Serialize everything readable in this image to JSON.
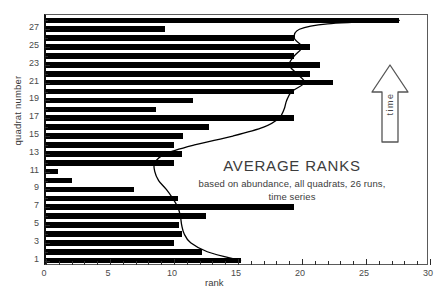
{
  "chart_data": {
    "type": "bar",
    "orientation": "horizontal",
    "title": "AVERAGE RANKS",
    "subtitle": "based on abundance, all quadrats, 26 runs,\ntime series",
    "subtitle_line1": "based on abundance, all quadrats, 26 runs,",
    "subtitle_line2": "time series",
    "xlabel": "rank",
    "ylabel": "quadrat number",
    "xlim": [
      0,
      30
    ],
    "ylim": [
      0.4,
      28.6
    ],
    "xticks": [
      0,
      5,
      10,
      15,
      20,
      25,
      30
    ],
    "xtick_labels": [
      "0",
      "5",
      "10",
      "15",
      "20",
      "25",
      "30"
    ],
    "xtick_minor_step": 1,
    "yticks": [
      1,
      3,
      5,
      7,
      9,
      11,
      13,
      15,
      17,
      19,
      21,
      23,
      25,
      27
    ],
    "ytick_labels": [
      "1",
      "3",
      "5",
      "7",
      "9",
      "11",
      "13",
      "15",
      "17",
      "19",
      "21",
      "23",
      "25",
      "27"
    ],
    "grid": false,
    "legend": null,
    "bar_color": "#000000",
    "frame_color": "#5a5a5a",
    "categories": [
      1,
      2,
      3,
      4,
      5,
      6,
      7,
      8,
      9,
      10,
      11,
      12,
      13,
      14,
      15,
      16,
      17,
      18,
      19,
      20,
      21,
      22,
      23,
      24,
      25,
      26,
      27,
      28
    ],
    "values": [
      15.2,
      12.2,
      10.0,
      10.6,
      10.4,
      12.5,
      19.4,
      10.3,
      6.9,
      2.0,
      0.9,
      10.0,
      10.6,
      10.0,
      10.7,
      12.7,
      19.4,
      8.6,
      11.5,
      19.4,
      22.4,
      20.6,
      21.4,
      19.4,
      20.6,
      19.4,
      9.3,
      27.6
    ],
    "curve": {
      "name": "average rank trend",
      "color": "#000000",
      "points": [
        {
          "x": 15.2,
          "y": 1
        },
        {
          "x": 12.6,
          "y": 2
        },
        {
          "x": 11.3,
          "y": 3
        },
        {
          "x": 10.8,
          "y": 4
        },
        {
          "x": 10.6,
          "y": 5
        },
        {
          "x": 10.5,
          "y": 6
        },
        {
          "x": 10.3,
          "y": 7
        },
        {
          "x": 9.9,
          "y": 8
        },
        {
          "x": 9.4,
          "y": 9
        },
        {
          "x": 8.8,
          "y": 10
        },
        {
          "x": 8.5,
          "y": 11
        },
        {
          "x": 8.5,
          "y": 12
        },
        {
          "x": 9.3,
          "y": 13
        },
        {
          "x": 11.6,
          "y": 14
        },
        {
          "x": 14.6,
          "y": 15
        },
        {
          "x": 17.0,
          "y": 16
        },
        {
          "x": 18.2,
          "y": 17
        },
        {
          "x": 18.6,
          "y": 18
        },
        {
          "x": 18.8,
          "y": 19
        },
        {
          "x": 19.2,
          "y": 20
        },
        {
          "x": 20.2,
          "y": 21
        },
        {
          "x": 19.6,
          "y": 22
        },
        {
          "x": 19.0,
          "y": 23
        },
        {
          "x": 19.4,
          "y": 24
        },
        {
          "x": 20.0,
          "y": 25
        },
        {
          "x": 19.4,
          "y": 26
        },
        {
          "x": 19.8,
          "y": 27
        },
        {
          "x": 22.0,
          "y": 27.6
        },
        {
          "x": 27.6,
          "y": 28
        }
      ]
    },
    "annotations": [
      {
        "name": "time-arrow",
        "label": "time",
        "direction": "up",
        "x": 27.3,
        "y_range": [
          15.5,
          23.5
        ]
      }
    ]
  },
  "axis": {
    "x_title": "rank",
    "y_title": "quadrat number"
  },
  "caption": {
    "title": "AVERAGE RANKS",
    "line1": "based on abundance, all quadrats, 26 runs,",
    "line2": "time series"
  },
  "time_arrow": {
    "label": "time"
  }
}
